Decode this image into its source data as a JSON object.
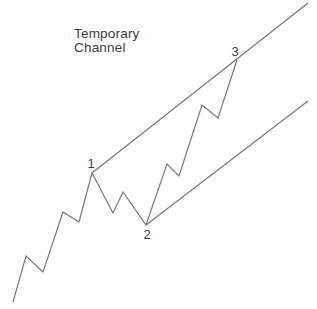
{
  "title": {
    "line1": "Temporary",
    "line2": "Channel"
  },
  "colors": {
    "background": "#ffffff",
    "line": "#787878",
    "text": "#3c3c3c"
  },
  "canvas": {
    "width": 317,
    "height": 309
  },
  "diagram": {
    "type": "line",
    "price_path_px": [
      [
        13,
        302
      ],
      [
        26,
        256
      ],
      [
        43,
        272
      ],
      [
        63,
        212
      ],
      [
        79,
        222
      ],
      [
        92,
        173
      ],
      [
        113,
        213
      ],
      [
        123,
        192
      ],
      [
        146,
        225
      ],
      [
        167,
        164
      ],
      [
        179,
        176
      ],
      [
        202,
        105
      ],
      [
        218,
        118
      ],
      [
        237,
        60
      ]
    ],
    "channel_lines": [
      {
        "name": "upper-channel-trendline",
        "x1": 92,
        "y1": 173,
        "x2": 308,
        "y2": 3
      },
      {
        "name": "lower-channel-trendline",
        "x1": 146,
        "y1": 225,
        "x2": 308,
        "y2": 101
      }
    ],
    "point_labels": [
      {
        "text": "1",
        "x": 91,
        "y": 168
      },
      {
        "text": "2",
        "x": 147,
        "y": 239
      },
      {
        "text": "3",
        "x": 235,
        "y": 56
      }
    ]
  }
}
